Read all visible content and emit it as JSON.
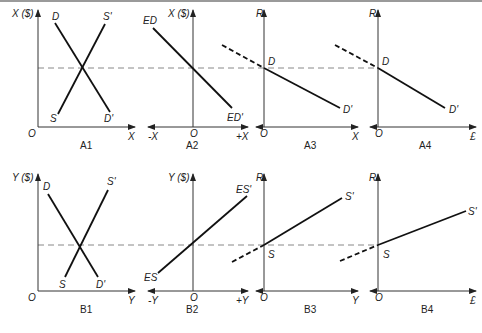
{
  "figure": {
    "top_rule_color": "#9a9a9a",
    "panels": {
      "A1": {
        "caption": "A1",
        "y_label": "X ($)",
        "origin": "O",
        "x_label": "X",
        "curve1_start": "D",
        "curve1_end": "D'",
        "curve2_start": "S",
        "curve2_end": "S'"
      },
      "A2": {
        "caption": "A2",
        "y_label": "X ($)",
        "origin": "O",
        "x_neg_label": "-X",
        "x_pos_label": "+X",
        "curve_start": "ED",
        "curve_end": "ED'"
      },
      "A3": {
        "caption": "A3",
        "y_label": "R",
        "origin": "O",
        "x_label": "X",
        "point_label": "D",
        "curve_end": "D'"
      },
      "A4": {
        "caption": "A4",
        "y_label": "R",
        "origin": "O",
        "x_label": "£",
        "point_label": "D",
        "curve_end": "D'"
      },
      "B1": {
        "caption": "B1",
        "y_label": "Y ($)",
        "origin": "O",
        "x_label": "Y",
        "curve1_start": "D",
        "curve1_end": "D'",
        "curve2_start": "S",
        "curve2_end": "S'"
      },
      "B2": {
        "caption": "B2",
        "y_label": "Y ($)",
        "origin": "O",
        "x_neg_label": "-Y",
        "x_pos_label": "+Y",
        "curve_start": "ES",
        "curve_end": "ES'"
      },
      "B3": {
        "caption": "B3",
        "y_label": "R",
        "origin": "O",
        "x_label": "Y",
        "point_label": "S",
        "curve_end": "S'"
      },
      "B4": {
        "caption": "B4",
        "y_label": "R",
        "origin": "O",
        "x_label": "£",
        "point_label": "S",
        "curve_end": "S'"
      }
    }
  }
}
